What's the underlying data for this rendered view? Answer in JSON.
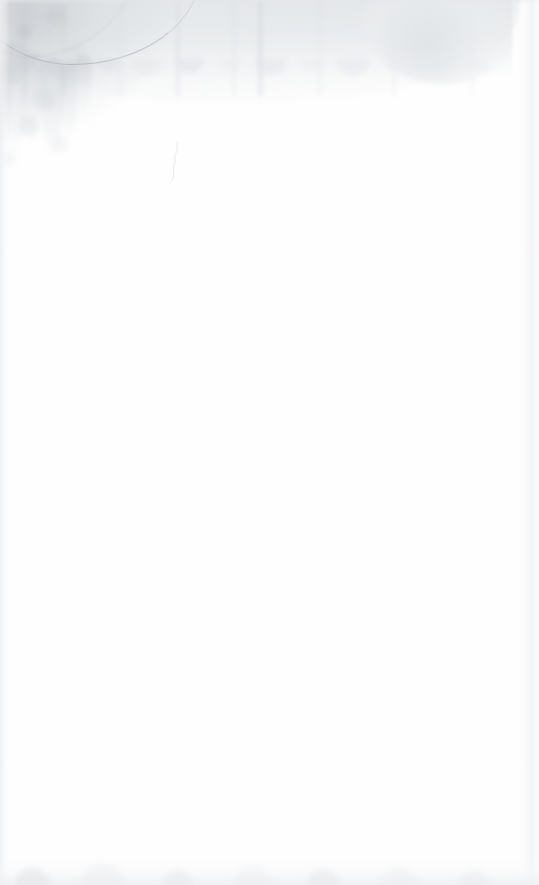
{
  "document": {
    "type": "scanned-page",
    "kind": "blank-page-with-stain",
    "page_text": "",
    "visible_text_present": false,
    "width_px": 539,
    "height_px": 885
  },
  "appearance": {
    "paper_color": "#fefefe",
    "stain_color": "#e4e7e9",
    "stain_deep_color": "#d2d6da",
    "tideline_color": "#9a9ea4",
    "edge_shadow_color": "#eceef0",
    "grain_color": "#aaaab4"
  },
  "marks": {
    "stain": {
      "name": "water-stain",
      "location": "top edge, spanning full width, heaviest at top-left",
      "top_band_height_px": 78,
      "right_terminus_x_px": 512,
      "left_drip_bottom_y_px": 165
    },
    "tideline": {
      "name": "tideline",
      "location": "diagonal arc across top-left, from left edge to about x=190",
      "darkest_tone": "#92969c"
    },
    "crease": {
      "name": "paper-crease",
      "location": "faint vertical squiggle near x=172, y=140-184"
    },
    "bottom_smudge": {
      "name": "bottom-edge-smudge",
      "location": "thin gray band along the bottom edge",
      "band_height_px": 22
    }
  }
}
